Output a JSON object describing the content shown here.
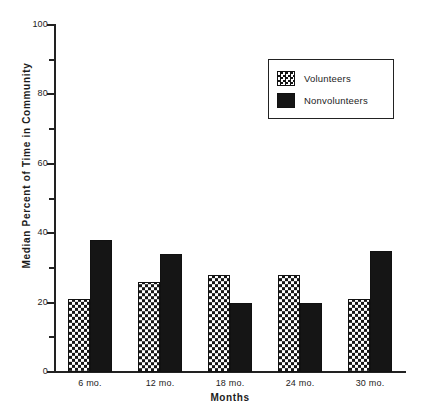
{
  "chart_data": {
    "type": "bar",
    "title": "",
    "subtitle": "",
    "xlabel": "Months",
    "ylabel": "Median Percent of Time in Community",
    "categories": [
      "6 mo.",
      "12 mo.",
      "18 mo.",
      "24 mo.",
      "30 mo."
    ],
    "series": [
      {
        "name": "Volunteers",
        "values": [
          21,
          26,
          28,
          28,
          21
        ],
        "pattern": "checkerboard",
        "color": "#151515"
      },
      {
        "name": "Nonvolunteers",
        "values": [
          38,
          34,
          20,
          20,
          35
        ],
        "pattern": "solid",
        "color": "#151515"
      }
    ],
    "ylim": [
      0,
      100
    ],
    "yticks": [
      0,
      20,
      40,
      60,
      80,
      100
    ],
    "yminorticks": [
      10,
      30,
      50,
      70,
      90
    ],
    "ytick_labels": [
      "0",
      "20",
      "40",
      "60",
      "80",
      "100"
    ],
    "grid": false,
    "legend_position": "upper right",
    "legend_entries": [
      "Volunteers",
      "Nonvolunteers"
    ]
  },
  "legend": {
    "items": [
      {
        "label": "Volunteers",
        "swatch": "checkerboard-swatch"
      },
      {
        "label": "Nonvolunteers",
        "swatch": "solid-black-swatch"
      }
    ]
  },
  "axes": {
    "y_title": "Median Percent of Time in Community",
    "x_title": "Months"
  },
  "colors": {
    "ink": "#1c1c1c",
    "fill": "#151515",
    "background": "#ffffff"
  }
}
